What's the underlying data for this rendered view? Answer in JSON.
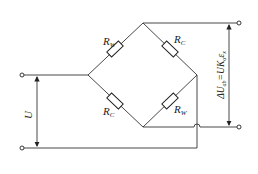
{
  "diagram": {
    "type": "wheatstone-bridge",
    "resistors": [
      {
        "id": "top-left",
        "label": "R",
        "sub": "W"
      },
      {
        "id": "top-right",
        "label": "R",
        "sub": "C"
      },
      {
        "id": "bottom-left",
        "label": "R",
        "sub": "C"
      },
      {
        "id": "bottom-right",
        "label": "R",
        "sub": "W"
      }
    ],
    "supply_label": "U",
    "output_label": "ΔU",
    "output_label_sub": "ab",
    "output_eq": "=UK",
    "output_eq_sub": "α",
    "output_eq_tail": "ε",
    "output_eq_tail_sub": "x"
  }
}
